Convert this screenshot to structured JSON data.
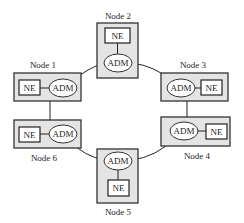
{
  "diagram": {
    "type": "SONET/SDH ring topology",
    "nodes": [
      {
        "id": 1,
        "label": "Node 1",
        "ne": "NE",
        "adm": "ADM"
      },
      {
        "id": 2,
        "label": "Node 2",
        "ne": "NE",
        "adm": "ADM"
      },
      {
        "id": 3,
        "label": "Node 3",
        "ne": "NE",
        "adm": "ADM"
      },
      {
        "id": 4,
        "label": "Node 4",
        "ne": "NE",
        "adm": "ADM"
      },
      {
        "id": 5,
        "label": "Node 5",
        "ne": "NE",
        "adm": "ADM"
      },
      {
        "id": 6,
        "label": "Node 6",
        "ne": "NE",
        "adm": "ADM"
      }
    ],
    "ring_links": [
      [
        "Node 1",
        "Node 2"
      ],
      [
        "Node 2",
        "Node 3"
      ],
      [
        "Node 3",
        "Node 4"
      ],
      [
        "Node 4",
        "Node 5"
      ],
      [
        "Node 5",
        "Node 6"
      ],
      [
        "Node 6",
        "Node 1"
      ]
    ],
    "colors": {
      "node_fill": "#e4e4e4",
      "stroke": "#333333",
      "element_fill": "#ffffff"
    }
  }
}
